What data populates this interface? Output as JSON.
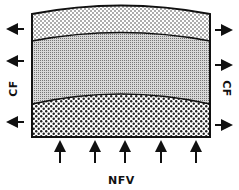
{
  "diagram": {
    "labels": {
      "left_side": "CF",
      "right_side": "CF",
      "bottom": "NFV"
    },
    "layers": [
      {
        "name": "upper-layer",
        "pattern": "fine-dots"
      },
      {
        "name": "middle-layer",
        "pattern": "dense-fine-dots"
      },
      {
        "name": "lower-layer",
        "pattern": "coarse-dots"
      }
    ],
    "arrows": {
      "left": {
        "direction": "left",
        "count": 3
      },
      "right": {
        "direction": "right",
        "count": 3
      },
      "bottom": {
        "direction": "up",
        "count": 5
      }
    },
    "colors": {
      "stroke": "#111111",
      "background": "#ffffff"
    }
  }
}
